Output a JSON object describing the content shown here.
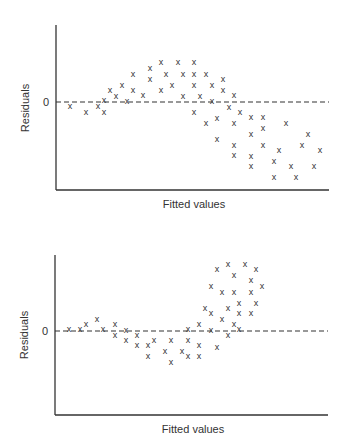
{
  "chart_data": [
    {
      "type": "scatter",
      "title": "",
      "xlabel": "Fitted values",
      "ylabel": "Residuals",
      "yticks": [
        "0"
      ],
      "marker": "x",
      "reference_line": {
        "y": 0,
        "style": "dashed"
      },
      "grid": false,
      "legend": null,
      "description": "Residuals follow a curved (inverted-U then decreasing) pattern around zero",
      "points_px": [
        [
          70,
          106
        ],
        [
          86,
          112
        ],
        [
          98,
          106
        ],
        [
          104,
          100
        ],
        [
          104,
          112
        ],
        [
          110,
          90
        ],
        [
          116,
          96
        ],
        [
          122,
          85
        ],
        [
          127,
          101
        ],
        [
          133,
          74
        ],
        [
          133,
          90
        ],
        [
          143,
          95
        ],
        [
          150,
          68
        ],
        [
          150,
          79
        ],
        [
          161,
          62
        ],
        [
          161,
          90
        ],
        [
          166,
          74
        ],
        [
          172,
          85
        ],
        [
          178,
          62
        ],
        [
          183,
          74
        ],
        [
          183,
          96
        ],
        [
          194,
          62
        ],
        [
          194,
          74
        ],
        [
          194,
          85
        ],
        [
          194,
          112
        ],
        [
          200,
          96
        ],
        [
          206,
          74
        ],
        [
          206,
          123
        ],
        [
          212,
          85
        ],
        [
          212,
          101
        ],
        [
          217,
          118
        ],
        [
          217,
          139
        ],
        [
          223,
          79
        ],
        [
          223,
          90
        ],
        [
          229,
          107
        ],
        [
          234,
          95
        ],
        [
          234,
          123
        ],
        [
          234,
          145
        ],
        [
          234,
          155
        ],
        [
          240,
          112
        ],
        [
          251,
          117
        ],
        [
          251,
          134
        ],
        [
          251,
          156
        ],
        [
          251,
          166
        ],
        [
          263,
          117
        ],
        [
          263,
          128
        ],
        [
          263,
          145
        ],
        [
          274,
          161
        ],
        [
          274,
          177
        ],
        [
          279,
          150
        ],
        [
          286,
          123
        ],
        [
          291,
          166
        ],
        [
          296,
          177
        ],
        [
          302,
          145
        ],
        [
          308,
          134
        ],
        [
          314,
          166
        ],
        [
          320,
          150
        ]
      ],
      "layout": {
        "x_axis_x": 56,
        "y_top": 25,
        "zero_y": 102,
        "x_axis_y": 190,
        "x_right": 329,
        "xlabel_y": 204,
        "ylabel_x": 26
      }
    },
    {
      "type": "scatter",
      "title": "",
      "xlabel": "Fitted values",
      "ylabel": "Residuals",
      "yticks": [
        "0"
      ],
      "marker": "x",
      "reference_line": {
        "y": 0,
        "style": "dashed"
      },
      "grid": false,
      "legend": null,
      "description": "Residuals near zero at low fitted values, dip negative, then spread widely positive (heteroscedastic / nonlinear)",
      "points_px": [
        [
          69,
          329
        ],
        [
          80,
          329
        ],
        [
          86,
          324
        ],
        [
          97,
          319
        ],
        [
          103,
          329
        ],
        [
          115,
          324
        ],
        [
          115,
          335
        ],
        [
          126,
          330
        ],
        [
          126,
          340
        ],
        [
          137,
          335
        ],
        [
          137,
          345
        ],
        [
          148,
          345
        ],
        [
          148,
          356
        ],
        [
          154,
          340
        ],
        [
          165,
          351
        ],
        [
          171,
          340
        ],
        [
          171,
          362
        ],
        [
          182,
          351
        ],
        [
          188,
          329
        ],
        [
          188,
          340
        ],
        [
          188,
          356
        ],
        [
          199,
          324
        ],
        [
          199,
          345
        ],
        [
          199,
          356
        ],
        [
          205,
          308
        ],
        [
          211,
          286
        ],
        [
          211,
          313
        ],
        [
          211,
          330
        ],
        [
          217,
          269
        ],
        [
          217,
          347
        ],
        [
          222,
          292
        ],
        [
          222,
          319
        ],
        [
          228,
          264
        ],
        [
          228,
          308
        ],
        [
          228,
          335
        ],
        [
          234,
          275
        ],
        [
          234,
          292
        ],
        [
          234,
          324
        ],
        [
          239,
          303
        ],
        [
          239,
          313
        ],
        [
          239,
          329
        ],
        [
          245,
          264
        ],
        [
          251,
          280
        ],
        [
          251,
          292
        ],
        [
          251,
          313
        ],
        [
          256,
          269
        ],
        [
          256,
          303
        ],
        [
          262,
          286
        ]
      ],
      "layout": {
        "x_axis_x": 55,
        "y_top": 255,
        "zero_y": 331,
        "x_axis_y": 415,
        "x_right": 328,
        "xlabel_y": 429,
        "ylabel_x": 25
      }
    }
  ],
  "labels": {
    "top_xlabel": "Fitted values",
    "top_ylabel": "Residuals",
    "top_zero": "0",
    "bottom_xlabel": "Fitted values",
    "bottom_ylabel": "Residuals",
    "bottom_zero": "0",
    "marker_glyph": "x"
  }
}
